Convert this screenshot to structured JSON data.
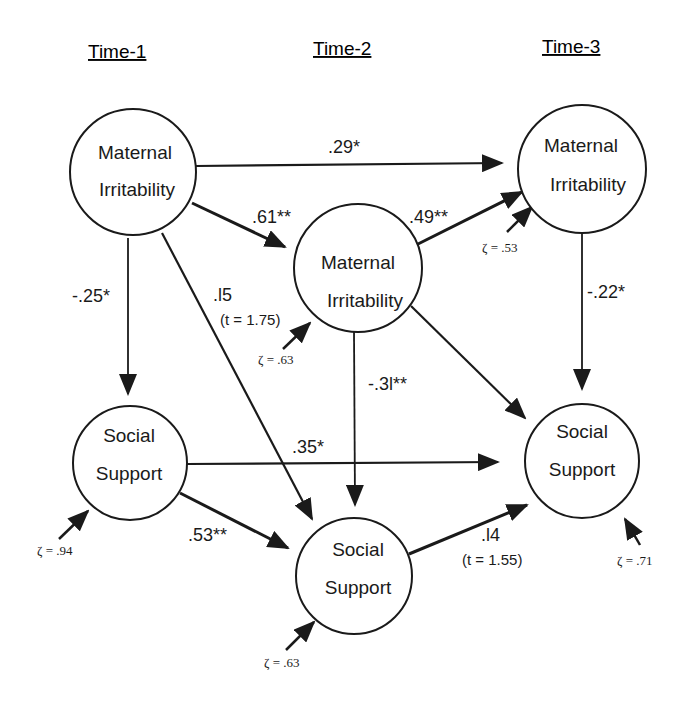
{
  "headers": [
    "Time-1",
    "Time-2",
    "Time-3"
  ],
  "nodes": {
    "mi1": {
      "line1": "Maternal",
      "line2": "Irritability"
    },
    "mi2": {
      "line1": "Maternal",
      "line2": "Irritability"
    },
    "mi3": {
      "line1": "Maternal",
      "line2": "Irritability"
    },
    "ss1": {
      "line1": "Social",
      "line2": "Support"
    },
    "ss2": {
      "line1": "Social",
      "line2": "Support"
    },
    "ss3": {
      "line1": "Social",
      "line2": "Support"
    }
  },
  "paths": {
    "mi1_mi3": ".29*",
    "mi1_mi2": ".61**",
    "mi2_mi3": ".49**",
    "mi1_ss1": "-.25*",
    "mi1_ss2": ".l5",
    "mi1_ss2_t": "(t  = 1.75)",
    "mi2_ss2": "-.3l**",
    "mi3_ss3": "-.22*",
    "ss1_ss3": ".35*",
    "ss1_ss2": ".53**",
    "ss2_ss3": ".l4",
    "ss2_ss3_t": "(t  = 1.55)"
  },
  "residuals": {
    "mi2": "ζ = .63",
    "mi3": "ζ = .53",
    "ss1": "ζ = .94",
    "ss2": "ζ = .63",
    "ss3": "ζ = .71"
  }
}
